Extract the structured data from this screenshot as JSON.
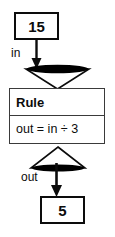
{
  "diagram": {
    "type": "function-machine",
    "input": {
      "value": "15",
      "port_label": "in"
    },
    "machine": {
      "header_label": "Rule",
      "expression": "out = in ÷ 3"
    },
    "output": {
      "value": "5",
      "port_label": "out"
    },
    "icons": {
      "funnel_in": "funnel-down-icon",
      "funnel_out": "funnel-up-icon",
      "arrow_in": "arrow-down-icon",
      "arrow_out": "arrow-down-icon"
    },
    "colors": {
      "stroke": "#0c0c0c",
      "rule_stroke": "#3a3a3a",
      "fill": "#ffffff",
      "accent_fill": "#000000",
      "background": "#ffffff"
    }
  }
}
